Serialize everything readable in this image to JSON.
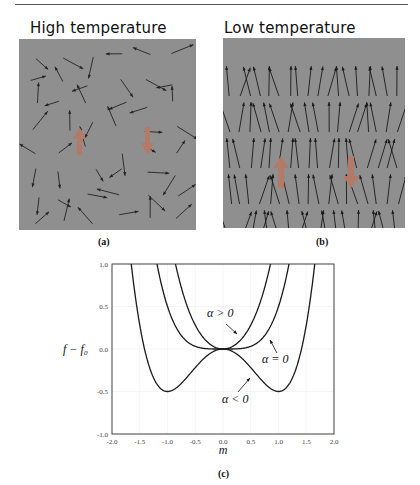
{
  "page": {
    "top_rule": true
  },
  "panels": [
    {
      "id": "a",
      "title": "High temperature",
      "caption": "(a)",
      "description": "Randomly oriented spins"
    },
    {
      "id": "b",
      "title": "Low temperature",
      "caption": "(b)",
      "description": "Spins mostly aligned upward"
    }
  ],
  "chart_caption": "(c)",
  "chart_data": {
    "type": "line",
    "title": "",
    "xlabel": "m",
    "ylabel": "f − f₀",
    "xlim": [
      -2.0,
      2.0
    ],
    "ylim": [
      -1.0,
      1.0
    ],
    "xticks": [
      "-2.0",
      "-1.5",
      "-1.0",
      "-0.5",
      "0.0",
      "0.5",
      "1.0",
      "1.5",
      "2.0"
    ],
    "yticks": [
      "-1.0",
      "-0.5",
      "0.0",
      "0.5",
      "1.0"
    ],
    "grid": true,
    "legend": "none (inline annotations)",
    "series": [
      {
        "name": "α > 0",
        "formula": "m^2 + m^4/2",
        "x": [
          -0.85,
          -0.5,
          0,
          0.5,
          0.85
        ],
        "y": [
          1.0,
          0.28,
          0.0,
          0.28,
          1.0
        ]
      },
      {
        "name": "α = 0",
        "formula": "m^4/2",
        "x": [
          -1.19,
          -1.0,
          -0.5,
          0,
          0.5,
          1.0,
          1.19
        ],
        "y": [
          1.0,
          0.5,
          0.03,
          0.0,
          0.03,
          0.5,
          1.0
        ]
      },
      {
        "name": "α < 0",
        "formula": "-m^2 + m^4/2",
        "x": [
          -1.65,
          -1.5,
          -1.0,
          -0.5,
          0,
          0.5,
          1.0,
          1.5,
          1.65
        ],
        "y": [
          1.0,
          0.28,
          -0.5,
          -0.22,
          0.0,
          -0.22,
          -0.5,
          0.28,
          1.0
        ]
      }
    ],
    "annotations": [
      {
        "text": "α > 0",
        "x": 0.05,
        "y": 0.38
      },
      {
        "text": "α = 0",
        "x": 0.92,
        "y": -0.1
      },
      {
        "text": "α < 0",
        "x": 0.18,
        "y": -0.6
      }
    ]
  }
}
